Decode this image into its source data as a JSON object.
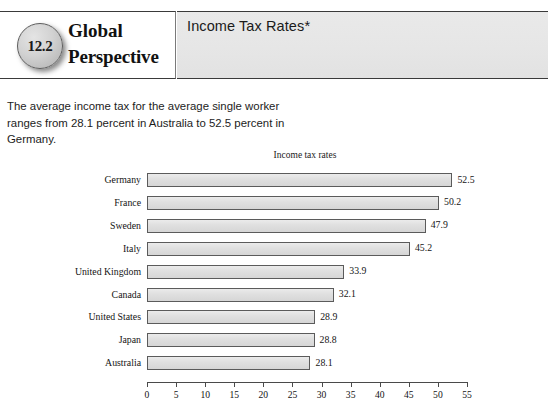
{
  "header": {
    "badge_number": "12.2",
    "feature_line1": "Global",
    "feature_line2": "Perspective",
    "title": "Income Tax Rates*"
  },
  "body": {
    "paragraph": "The average income tax for the average single worker ranges from 28.1 percent in Australia to 52.5 percent in Germany."
  },
  "chart_data": {
    "type": "bar",
    "orientation": "horizontal",
    "title": "Income tax rates",
    "xlabel": "",
    "ylabel": "",
    "xlim": [
      0,
      55
    ],
    "xticks": [
      0,
      5,
      10,
      15,
      20,
      25,
      30,
      35,
      40,
      45,
      50,
      55
    ],
    "xtick_labels": [
      "0",
      "5",
      "10",
      "15",
      "20",
      "25",
      "30",
      "35",
      "40",
      "45",
      "50",
      "55"
    ],
    "grid": false,
    "legend": false,
    "categories": [
      "Germany",
      "France",
      "Sweden",
      "Italy",
      "United Kingdom",
      "Canada",
      "United States",
      "Japan",
      "Australia"
    ],
    "values": [
      52.5,
      50.2,
      47.9,
      45.2,
      33.9,
      32.1,
      28.9,
      28.8,
      28.1
    ],
    "data_labels": [
      "52.5",
      "50.2",
      "47.9",
      "45.2",
      "33.9",
      "32.1",
      "28.9",
      "28.8",
      "28.1"
    ],
    "bar_fill": "#e0e0e0",
    "bar_edge": "#5b5b5b"
  }
}
